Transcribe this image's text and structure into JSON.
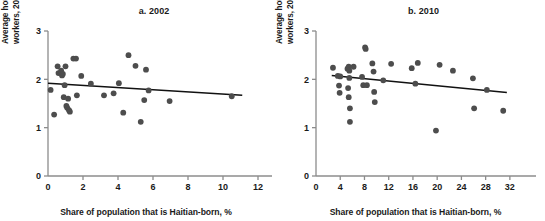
{
  "figure": {
    "dot_color": "#4d4d4d",
    "line_color": "#111111",
    "axis_color": "#8c8c8c"
  },
  "chart_data": [
    {
      "type": "scatter",
      "title": "a. 2002",
      "xlabel": "Share of population that is Haitian-born, %",
      "ylabel": "Average hourly wage for Dominican-born workers, 2005 US$ PPP",
      "xlim": [
        0,
        12
      ],
      "ylim": [
        0,
        3
      ],
      "xticks": [
        0,
        2,
        4,
        6,
        8,
        10,
        12
      ],
      "yticks": [
        0,
        1,
        2,
        3
      ],
      "grid": false,
      "legend": "none",
      "points": [
        {
          "x": 0.15,
          "y": 1.78
        },
        {
          "x": 0.35,
          "y": 1.27
        },
        {
          "x": 0.55,
          "y": 2.27
        },
        {
          "x": 0.6,
          "y": 2.13
        },
        {
          "x": 0.75,
          "y": 2.18
        },
        {
          "x": 0.8,
          "y": 2.08
        },
        {
          "x": 0.85,
          "y": 2.11
        },
        {
          "x": 0.9,
          "y": 1.63
        },
        {
          "x": 0.95,
          "y": 1.88
        },
        {
          "x": 1.0,
          "y": 2.27
        },
        {
          "x": 1.05,
          "y": 1.45
        },
        {
          "x": 1.1,
          "y": 1.41
        },
        {
          "x": 1.15,
          "y": 1.6
        },
        {
          "x": 1.2,
          "y": 1.36
        },
        {
          "x": 1.25,
          "y": 1.33
        },
        {
          "x": 1.45,
          "y": 2.43
        },
        {
          "x": 1.6,
          "y": 2.43
        },
        {
          "x": 1.65,
          "y": 1.67
        },
        {
          "x": 1.9,
          "y": 2.07
        },
        {
          "x": 2.45,
          "y": 1.91
        },
        {
          "x": 3.2,
          "y": 1.67
        },
        {
          "x": 3.75,
          "y": 1.71
        },
        {
          "x": 4.05,
          "y": 1.92
        },
        {
          "x": 4.3,
          "y": 1.31
        },
        {
          "x": 4.6,
          "y": 2.5
        },
        {
          "x": 5.0,
          "y": 2.28
        },
        {
          "x": 5.3,
          "y": 1.12
        },
        {
          "x": 5.5,
          "y": 1.57
        },
        {
          "x": 5.6,
          "y": 2.2
        },
        {
          "x": 5.75,
          "y": 1.77
        },
        {
          "x": 6.95,
          "y": 1.55
        },
        {
          "x": 10.5,
          "y": 1.65
        }
      ],
      "trendline": {
        "x0": 0,
        "y0": 1.92,
        "x1": 11.1,
        "y1": 1.67
      }
    },
    {
      "type": "scatter",
      "title": "b. 2010",
      "xlabel": "Share of population that is Haitian-born, %",
      "ylabel": "Average hourly wage for Dominican-born workers, 2005 US$ PPP",
      "xlim": [
        0,
        34
      ],
      "ylim": [
        0,
        3
      ],
      "xticks": [
        0,
        4,
        8,
        12,
        16,
        20,
        24,
        28,
        32
      ],
      "yticks": [
        0,
        1,
        2,
        3
      ],
      "grid": false,
      "legend": "none",
      "points": [
        {
          "x": 2.8,
          "y": 2.24
        },
        {
          "x": 3.6,
          "y": 2.07
        },
        {
          "x": 3.8,
          "y": 1.87
        },
        {
          "x": 3.9,
          "y": 1.72
        },
        {
          "x": 4.0,
          "y": 2.06
        },
        {
          "x": 5.2,
          "y": 2.22
        },
        {
          "x": 5.4,
          "y": 2.26
        },
        {
          "x": 5.5,
          "y": 2.18
        },
        {
          "x": 5.5,
          "y": 2.03
        },
        {
          "x": 5.3,
          "y": 1.82
        },
        {
          "x": 5.4,
          "y": 1.63
        },
        {
          "x": 5.6,
          "y": 1.4
        },
        {
          "x": 5.6,
          "y": 1.12
        },
        {
          "x": 6.2,
          "y": 2.26
        },
        {
          "x": 7.6,
          "y": 2.05
        },
        {
          "x": 7.8,
          "y": 1.88
        },
        {
          "x": 8.1,
          "y": 2.66
        },
        {
          "x": 8.2,
          "y": 2.63
        },
        {
          "x": 8.4,
          "y": 1.88
        },
        {
          "x": 9.3,
          "y": 2.33
        },
        {
          "x": 9.5,
          "y": 2.16
        },
        {
          "x": 9.6,
          "y": 1.74
        },
        {
          "x": 9.7,
          "y": 1.53
        },
        {
          "x": 11.1,
          "y": 1.98
        },
        {
          "x": 12.4,
          "y": 2.32
        },
        {
          "x": 15.8,
          "y": 2.23
        },
        {
          "x": 16.4,
          "y": 1.91
        },
        {
          "x": 16.8,
          "y": 2.34
        },
        {
          "x": 19.8,
          "y": 0.94
        },
        {
          "x": 20.4,
          "y": 2.3
        },
        {
          "x": 22.6,
          "y": 2.18
        },
        {
          "x": 25.9,
          "y": 2.02
        },
        {
          "x": 26.1,
          "y": 1.4
        },
        {
          "x": 28.2,
          "y": 1.78
        },
        {
          "x": 30.9,
          "y": 1.35
        }
      ],
      "trendline": {
        "x0": 2.6,
        "y0": 2.08,
        "x1": 31.5,
        "y1": 1.73
      }
    }
  ]
}
